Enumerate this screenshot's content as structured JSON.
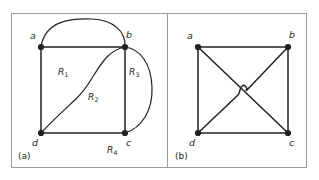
{
  "figure": {
    "caption_a": "(a)",
    "caption_b": "(b)",
    "frame_color": "#9a9a9a",
    "ink_color": "#231f20",
    "background_color": "#ffffff"
  },
  "panel_a": {
    "name": "planar-embedding-with-regions",
    "vertices": [
      {
        "id": "a",
        "label": "a",
        "x": 41,
        "y": 47
      },
      {
        "id": "b",
        "label": "b",
        "x": 125,
        "y": 47
      },
      {
        "id": "c",
        "label": "c",
        "x": 125,
        "y": 133
      },
      {
        "id": "d",
        "label": "d",
        "x": 41,
        "y": 133
      }
    ],
    "edges": [
      {
        "from": "a",
        "to": "b",
        "kind": "straight"
      },
      {
        "from": "a",
        "to": "d",
        "kind": "straight"
      },
      {
        "from": "b",
        "to": "c",
        "kind": "straight"
      },
      {
        "from": "d",
        "to": "c",
        "kind": "straight"
      },
      {
        "from": "a",
        "to": "b",
        "kind": "outer-arc"
      },
      {
        "from": "d",
        "to": "b",
        "kind": "s-curve"
      },
      {
        "from": "c",
        "to": "a",
        "kind": "outer-right-arc"
      }
    ],
    "regions": [
      {
        "label": "R",
        "sub": "1",
        "x": 63,
        "y": 73
      },
      {
        "label": "R",
        "sub": "2",
        "x": 92,
        "y": 98
      },
      {
        "label": "R",
        "sub": "3",
        "x": 132,
        "y": 73
      },
      {
        "label": "R",
        "sub": "4",
        "x": 111,
        "y": 151
      }
    ]
  },
  "panel_b": {
    "name": "nonplanar-drawing-with-crossing",
    "vertices": [
      {
        "id": "a",
        "label": "a",
        "x": 198,
        "y": 47
      },
      {
        "id": "b",
        "label": "b",
        "x": 288,
        "y": 47
      },
      {
        "id": "c",
        "label": "c",
        "x": 288,
        "y": 133
      },
      {
        "id": "d",
        "label": "d",
        "x": 198,
        "y": 133
      }
    ],
    "edges": [
      {
        "from": "a",
        "to": "b",
        "kind": "straight"
      },
      {
        "from": "a",
        "to": "d",
        "kind": "straight"
      },
      {
        "from": "b",
        "to": "c",
        "kind": "straight"
      },
      {
        "from": "d",
        "to": "c",
        "kind": "straight"
      },
      {
        "from": "a",
        "to": "c",
        "kind": "diagonal"
      },
      {
        "from": "d",
        "to": "b",
        "kind": "diagonal-with-hop"
      }
    ],
    "crossing": {
      "x": 243,
      "y": 90,
      "style": "hop-bridge"
    }
  }
}
